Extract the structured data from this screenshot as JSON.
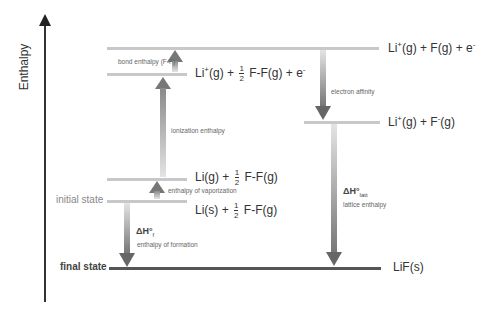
{
  "axis": {
    "label": "Enthalpy"
  },
  "levels": {
    "top": {
      "species": "Li",
      "charge": "+",
      "rest": "(g) + F(g) + e",
      "e_charge": "-"
    },
    "ionized": {
      "species": "Li",
      "charge": "+",
      "mid": "(g) +",
      "frac_num": "1",
      "frac_den": "2",
      "rest": "F-F(g) + e",
      "e_charge": "-"
    },
    "ion_atom": {
      "species": "Li",
      "charge": "+",
      "mid": "(g) + F",
      "f_charge": "-",
      "rest": "(g)"
    },
    "gas": {
      "pre": "Li(g) +",
      "frac_num": "1",
      "frac_den": "2",
      "rest": "F-F(g)"
    },
    "initial": {
      "pre": "Li(s) +",
      "frac_num": "1",
      "frac_den": "2",
      "rest": "F-F(g)"
    },
    "final": {
      "text": "LiF(s)"
    }
  },
  "side_labels": {
    "initial": "initial state",
    "final": "final state"
  },
  "steps": {
    "bond": "bond enthalpy (F-F)",
    "ionization": "ionization enthalpy",
    "vaporization": "enthalpy of vaporization",
    "formation_symbol": "ΔH°",
    "formation_sub": "f",
    "formation": "enthalpy of formation",
    "electron_affinity": "electron affinity",
    "lattice_symbol": "ΔH°",
    "lattice_sub": "latt",
    "lattice": "lattice enthalpy"
  }
}
